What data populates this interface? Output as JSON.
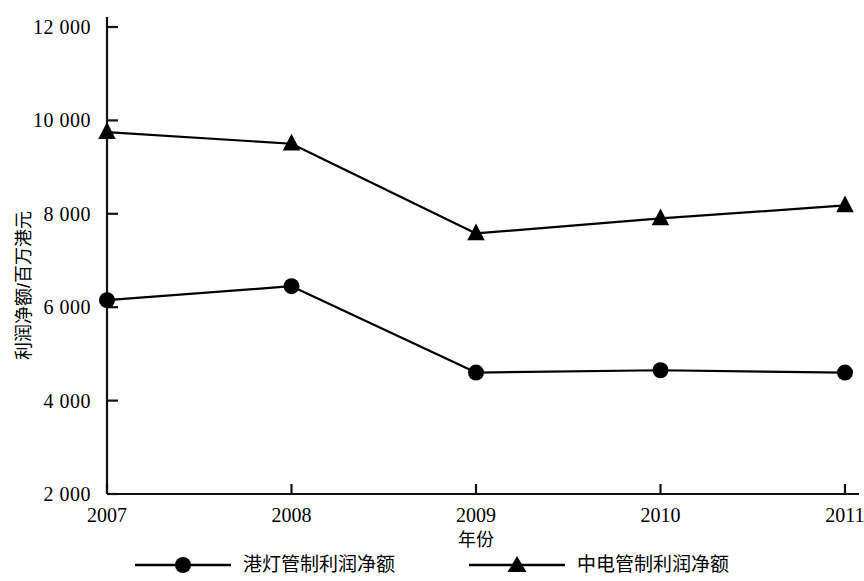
{
  "chart_data": {
    "type": "line",
    "title": "",
    "xlabel": "年份",
    "ylabel": "利润净额/百万港元",
    "categories": [
      "2007",
      "2008",
      "2009",
      "2010",
      "2011"
    ],
    "x": [
      2007,
      2008,
      2009,
      2010,
      2011
    ],
    "xlim": [
      2007,
      2011
    ],
    "ylim": [
      2000,
      12000
    ],
    "yticks": [
      "2 000",
      "4 000",
      "6 000",
      "8 000",
      "10 000",
      "12 000"
    ],
    "ytick_values": [
      2000,
      4000,
      6000,
      8000,
      10000,
      12000
    ],
    "grid": false,
    "legend_position": "bottom",
    "series": [
      {
        "name": "港灯管制利润净额",
        "marker": "circle",
        "color": "#000000",
        "values": [
          6150,
          6450,
          4600,
          4650,
          4600
        ]
      },
      {
        "name": "中电管制利润净额",
        "marker": "triangle",
        "color": "#000000",
        "values": [
          9750,
          9500,
          7580,
          7900,
          8180
        ]
      }
    ]
  },
  "legend": {
    "entries": [
      {
        "label": "港灯管制利润净额",
        "marker": "circle"
      },
      {
        "label": "中电管制利润净额",
        "marker": "triangle"
      }
    ]
  }
}
